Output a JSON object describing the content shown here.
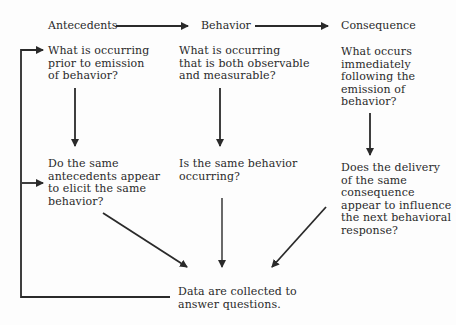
{
  "diagram": {
    "headers": {
      "antecedents": "Antecedents",
      "behavior": "Behavior",
      "consequence": "Consequence"
    },
    "questions": {
      "antecedents_q1": "What is occurring\nprior to emission\nof behavior?",
      "behavior_q1": "What is occurring\nthat is both observable\nand measurable?",
      "consequence_q1": "What occurs\nimmediately\nfollowing the\nemission of\nbehavior?",
      "antecedents_q2": "Do the same\nantecedents appear\nto elicit the same\nbehavior?",
      "behavior_q2": "Is the same behavior\noccurring?",
      "consequence_q2": "Does the delivery\nof the same\nconsequence\nappear to influence\nthe next behavioral\nresponse?"
    },
    "outcome": "Data are collected to\nanswer questions.",
    "colors": {
      "line": "#2a2a2a",
      "text": "#2a2a2a",
      "background": "#fdfdfd"
    }
  }
}
